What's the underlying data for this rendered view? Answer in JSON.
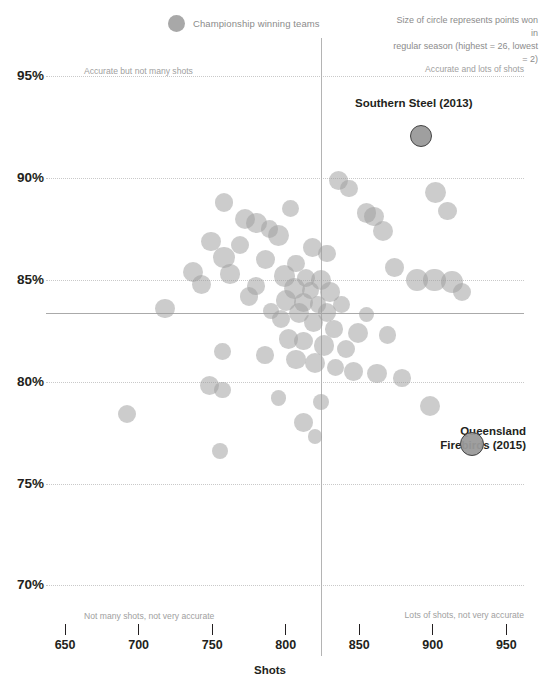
{
  "legend": {
    "champion_label": "Championship winning teams",
    "champion_swatch_color": "#a8a8a8",
    "size_note_line1": "Size of circle represents points won in",
    "size_note_line2": "regular season (highest = 26, lowest = 2)"
  },
  "quadrants": {
    "top_left": "Accurate but not many shots",
    "top_right": "Accurate and lots of shots",
    "bottom_left": "Not many shots, not very accurate",
    "bottom_right": "Lots of shots, not very accurate"
  },
  "callouts": {
    "southern_steel": "Southern Steel (2013)",
    "queensland_firebirds_line1": "Queensland",
    "queensland_firebirds_line2": "Firebirds (2015)"
  },
  "axes": {
    "x_title": "Shots",
    "y_title": "Accuracy %",
    "x_ticks": [
      "650",
      "700",
      "750",
      "800",
      "850",
      "900",
      "950"
    ],
    "y_ticks": [
      "95%",
      "90%",
      "85%",
      "80%",
      "75%",
      "70%"
    ]
  },
  "chart_data": {
    "type": "scatter",
    "title": "",
    "xlabel": "Shots",
    "ylabel": "Accuracy %",
    "xlim": [
      637,
      962
    ],
    "ylim": [
      68.2,
      96.2
    ],
    "x_ticks": [
      650,
      700,
      750,
      800,
      850,
      900,
      950
    ],
    "y_ticks": [
      70,
      75,
      80,
      85,
      90,
      95
    ],
    "grid": "horizontal-dotted",
    "legend_position": "top-center",
    "size_encoding": {
      "meaning": "points won in regular season",
      "highest": 26,
      "lowest": 2
    },
    "reference_lines": {
      "horizontal_accuracy": 83.4,
      "vertical_shots": 824
    },
    "quadrant_annotations": {
      "top_left": "Accurate but not many shots",
      "top_right": "Accurate and lots of shots",
      "bottom_left": "Not many shots, not very accurate",
      "bottom_right": "Lots of shots, not very accurate"
    },
    "highlighted_points": [
      {
        "label": "Southern Steel (2013)",
        "shots": 891,
        "accuracy": 92.1,
        "points": 14,
        "champion": true
      },
      {
        "label": "Queensland Firebirds (2015)",
        "shots": 926,
        "accuracy": 77.0,
        "points": 20,
        "champion": true
      }
    ],
    "points": [
      {
        "shots": 891,
        "accuracy": 92.1,
        "points": 14,
        "champion": true
      },
      {
        "shots": 926,
        "accuracy": 77.0,
        "points": 20,
        "champion": true
      },
      {
        "shots": 836,
        "accuracy": 89.9,
        "points": 12
      },
      {
        "shots": 843,
        "accuracy": 89.5,
        "points": 9
      },
      {
        "shots": 902,
        "accuracy": 89.3,
        "points": 16
      },
      {
        "shots": 758,
        "accuracy": 88.8,
        "points": 11
      },
      {
        "shots": 803,
        "accuracy": 88.5,
        "points": 8
      },
      {
        "shots": 910,
        "accuracy": 88.4,
        "points": 10
      },
      {
        "shots": 855,
        "accuracy": 88.3,
        "points": 13
      },
      {
        "shots": 860,
        "accuracy": 88.1,
        "points": 12
      },
      {
        "shots": 772,
        "accuracy": 88.0,
        "points": 14
      },
      {
        "shots": 780,
        "accuracy": 87.8,
        "points": 15
      },
      {
        "shots": 789,
        "accuracy": 87.5,
        "points": 9
      },
      {
        "shots": 866,
        "accuracy": 87.4,
        "points": 14
      },
      {
        "shots": 795,
        "accuracy": 87.2,
        "points": 16
      },
      {
        "shots": 749,
        "accuracy": 86.9,
        "points": 13
      },
      {
        "shots": 769,
        "accuracy": 86.7,
        "points": 10
      },
      {
        "shots": 818,
        "accuracy": 86.6,
        "points": 11
      },
      {
        "shots": 828,
        "accuracy": 86.3,
        "points": 9
      },
      {
        "shots": 758,
        "accuracy": 86.1,
        "points": 18
      },
      {
        "shots": 786,
        "accuracy": 86.0,
        "points": 12
      },
      {
        "shots": 807,
        "accuracy": 85.8,
        "points": 8
      },
      {
        "shots": 874,
        "accuracy": 85.6,
        "points": 11
      },
      {
        "shots": 737,
        "accuracy": 85.4,
        "points": 15
      },
      {
        "shots": 762,
        "accuracy": 85.3,
        "points": 13
      },
      {
        "shots": 799,
        "accuracy": 85.2,
        "points": 17
      },
      {
        "shots": 814,
        "accuracy": 85.1,
        "points": 10
      },
      {
        "shots": 824,
        "accuracy": 85.0,
        "points": 14
      },
      {
        "shots": 889,
        "accuracy": 85.0,
        "points": 19
      },
      {
        "shots": 901,
        "accuracy": 85.0,
        "points": 21
      },
      {
        "shots": 913,
        "accuracy": 84.9,
        "points": 18
      },
      {
        "shots": 743,
        "accuracy": 84.8,
        "points": 12
      },
      {
        "shots": 780,
        "accuracy": 84.7,
        "points": 9
      },
      {
        "shots": 806,
        "accuracy": 84.6,
        "points": 16
      },
      {
        "shots": 817,
        "accuracy": 84.5,
        "points": 8
      },
      {
        "shots": 830,
        "accuracy": 84.4,
        "points": 13
      },
      {
        "shots": 920,
        "accuracy": 84.4,
        "points": 10
      },
      {
        "shots": 775,
        "accuracy": 84.2,
        "points": 11
      },
      {
        "shots": 800,
        "accuracy": 84.0,
        "points": 15
      },
      {
        "shots": 812,
        "accuracy": 83.9,
        "points": 12
      },
      {
        "shots": 822,
        "accuracy": 83.8,
        "points": 7
      },
      {
        "shots": 838,
        "accuracy": 83.8,
        "points": 9
      },
      {
        "shots": 718,
        "accuracy": 83.6,
        "points": 13
      },
      {
        "shots": 790,
        "accuracy": 83.5,
        "points": 6
      },
      {
        "shots": 809,
        "accuracy": 83.4,
        "points": 14
      },
      {
        "shots": 828,
        "accuracy": 83.4,
        "points": 11
      },
      {
        "shots": 855,
        "accuracy": 83.3,
        "points": 5
      },
      {
        "shots": 797,
        "accuracy": 83.1,
        "points": 10
      },
      {
        "shots": 819,
        "accuracy": 82.9,
        "points": 12
      },
      {
        "shots": 833,
        "accuracy": 82.6,
        "points": 9
      },
      {
        "shots": 849,
        "accuracy": 82.4,
        "points": 15
      },
      {
        "shots": 869,
        "accuracy": 82.3,
        "points": 8
      },
      {
        "shots": 802,
        "accuracy": 82.1,
        "points": 13
      },
      {
        "shots": 812,
        "accuracy": 82.0,
        "points": 11
      },
      {
        "shots": 826,
        "accuracy": 81.8,
        "points": 16
      },
      {
        "shots": 841,
        "accuracy": 81.6,
        "points": 10
      },
      {
        "shots": 757,
        "accuracy": 81.5,
        "points": 7
      },
      {
        "shots": 786,
        "accuracy": 81.3,
        "points": 9
      },
      {
        "shots": 807,
        "accuracy": 81.1,
        "points": 12
      },
      {
        "shots": 820,
        "accuracy": 80.9,
        "points": 14
      },
      {
        "shots": 834,
        "accuracy": 80.7,
        "points": 8
      },
      {
        "shots": 846,
        "accuracy": 80.5,
        "points": 11
      },
      {
        "shots": 862,
        "accuracy": 80.4,
        "points": 13
      },
      {
        "shots": 879,
        "accuracy": 80.2,
        "points": 9
      },
      {
        "shots": 748,
        "accuracy": 79.8,
        "points": 12
      },
      {
        "shots": 757,
        "accuracy": 79.6,
        "points": 7
      },
      {
        "shots": 795,
        "accuracy": 79.2,
        "points": 5
      },
      {
        "shots": 824,
        "accuracy": 79.0,
        "points": 6
      },
      {
        "shots": 898,
        "accuracy": 78.8,
        "points": 15
      },
      {
        "shots": 692,
        "accuracy": 78.4,
        "points": 10
      },
      {
        "shots": 812,
        "accuracy": 78.0,
        "points": 11
      },
      {
        "shots": 820,
        "accuracy": 77.3,
        "points": 4
      },
      {
        "shots": 755,
        "accuracy": 76.6,
        "points": 6
      }
    ]
  }
}
